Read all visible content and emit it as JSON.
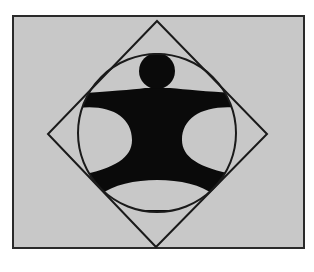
{
  "figure": {
    "colors": {
      "page_background": "#ffffff",
      "panel_fill": "#c8c8c8",
      "stroke": "#1a1a1a",
      "figure_fill": "#0a0a0a"
    },
    "panel": {
      "x": 13,
      "y": 16,
      "width": 291,
      "height": 232
    },
    "diamond": {
      "top": [
        157,
        21
      ],
      "right": [
        267,
        134
      ],
      "bottom": [
        156,
        247
      ],
      "left": [
        48,
        134
      ]
    },
    "circle": {
      "cx": 157,
      "cy": 133,
      "r": 79
    },
    "head": {
      "cx": 157,
      "cy": 71,
      "r": 18
    },
    "shapes": [
      "rectangle",
      "diamond",
      "circle",
      "human-figure"
    ]
  }
}
